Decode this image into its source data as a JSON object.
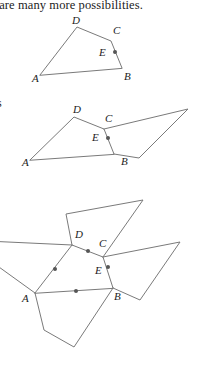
{
  "page": {
    "width": 198,
    "height": 375,
    "background": "#ffffff",
    "line_color": "#7a7a7a",
    "dot_color": "#565656",
    "text_color": "#1c1c1c"
  },
  "top_text": "re are many more possibilities.",
  "side_text": "s",
  "figures": [
    {
      "name": "figure-1-quadrilateral",
      "labels": [
        {
          "text": "A",
          "x": 32,
          "y": 82
        },
        {
          "text": "B",
          "x": 124,
          "y": 80
        },
        {
          "text": "C",
          "x": 113,
          "y": 34
        },
        {
          "text": "D",
          "x": 72,
          "y": 24
        },
        {
          "text": "E",
          "x": 99,
          "y": 56
        }
      ],
      "vertices": {
        "A": [
          40,
          75
        ],
        "B": [
          122,
          68
        ],
        "C": [
          111,
          41
        ],
        "D": [
          77,
          27
        ],
        "E": [
          115,
          52
        ]
      },
      "dots": [
        [
          115,
          52
        ]
      ]
    },
    {
      "name": "figure-2-quadrilateral-with-parallelogram",
      "labels": [
        {
          "text": "A",
          "x": 22,
          "y": 166
        },
        {
          "text": "B",
          "x": 121,
          "y": 165
        },
        {
          "text": "C",
          "x": 105,
          "y": 122
        },
        {
          "text": "D",
          "x": 73,
          "y": 113
        },
        {
          "text": "E",
          "x": 92,
          "y": 141
        }
      ],
      "vertices": {
        "A": [
          30,
          160
        ],
        "B": [
          114,
          154
        ],
        "C": [
          104,
          129
        ],
        "D": [
          74,
          117
        ],
        "E": [
          108,
          138
        ]
      },
      "dots": [
        [
          108,
          138
        ]
      ]
    },
    {
      "name": "figure-3-tessellation",
      "labels": [
        {
          "text": "A",
          "x": 22,
          "y": 300
        },
        {
          "text": "B",
          "x": 113,
          "y": 300
        },
        {
          "text": "C",
          "x": 98,
          "y": 247
        },
        {
          "text": "D",
          "x": 76,
          "y": 238
        },
        {
          "text": "E",
          "x": 96,
          "y": 274
        }
      ],
      "vertices": {
        "A": [
          35,
          293
        ],
        "B": [
          113,
          288
        ],
        "C": [
          103,
          257
        ],
        "D": [
          72,
          245
        ],
        "E": [
          108,
          267
        ]
      },
      "dots": [
        [
          88,
          251
        ],
        [
          108,
          267
        ],
        [
          75,
          270
        ],
        [
          75,
          290
        ]
      ]
    }
  ]
}
